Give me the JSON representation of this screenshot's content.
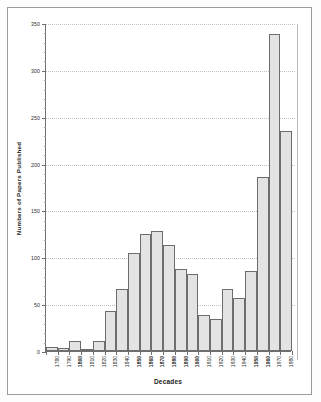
{
  "chart_data": {
    "type": "bar",
    "title": "",
    "xlabel": "Decades",
    "ylabel": "Numbers of Papers Published",
    "categories": [
      "1780",
      "1790",
      "1800",
      "1810",
      "1820",
      "1830",
      "1840",
      "1850",
      "1860",
      "1870",
      "1880",
      "1890",
      "1900",
      "1910",
      "1920",
      "1930",
      "1940",
      "1950",
      "1960",
      "1970",
      "1980"
    ],
    "values": [
      4,
      3,
      11,
      2,
      11,
      43,
      66,
      105,
      125,
      128,
      113,
      88,
      82,
      38,
      34,
      66,
      57,
      85,
      186,
      338,
      235
    ],
    "ylim": [
      0,
      350
    ],
    "yticks": [
      0,
      50,
      100,
      150,
      200,
      250,
      300,
      350
    ],
    "ytick_labels": [
      "0",
      "50",
      "100",
      "150",
      "200",
      "250",
      "300",
      "350"
    ],
    "grid": true,
    "legend": "none",
    "bar_fill": "#e3e3e3",
    "bar_stroke": "#6d6d6d",
    "axis_color": "#6f6f6f",
    "grid_color": "#c2c2c2",
    "bold_tick_labels": [
      "1800",
      "1850",
      "1860",
      "1870",
      "1880",
      "1890",
      "1900",
      "1950",
      "1960"
    ]
  }
}
